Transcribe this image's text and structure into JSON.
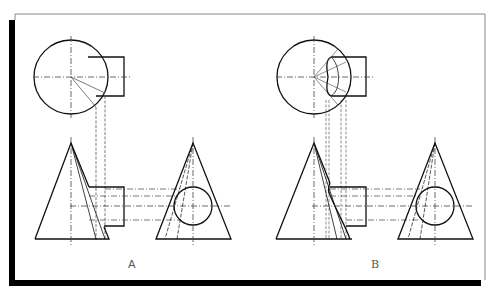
{
  "figure": {
    "title": "",
    "panels": [
      {
        "id": "panel-a",
        "label": "A",
        "description": "Cone with horizontal cylinder penetration — intersection approximated by straight generator lines"
      },
      {
        "id": "panel-b",
        "label": "B",
        "description": "Cone with horizontal cylinder penetration — true curved intersection line"
      }
    ],
    "colors": {
      "line": "#111111",
      "centerline": "#444444",
      "frame_shadow": "#000000",
      "frame_border": "#888888",
      "background": "#ffffff"
    }
  }
}
